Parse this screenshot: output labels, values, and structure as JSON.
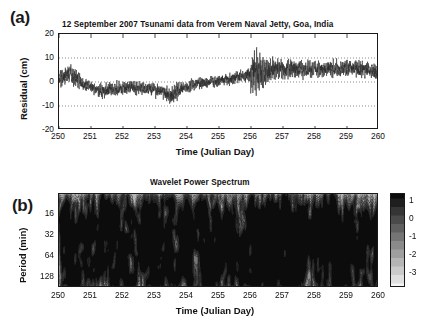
{
  "figure": {
    "panel_a_tag": "(a)",
    "panel_b_tag": "(b)"
  },
  "chart_data": [
    {
      "type": "line",
      "panel": "a",
      "title": "12  September 2007 Tsunami data from Verem Naval Jetty, Goa, India",
      "xlabel": "Time (Julian Day)",
      "ylabel": "Residual (cm)",
      "xlim": [
        250,
        260
      ],
      "ylim": [
        -20,
        20
      ],
      "xticks": [
        250,
        251,
        252,
        253,
        254,
        255,
        256,
        257,
        258,
        259,
        260
      ],
      "xticklabels": [
        "250",
        "251",
        "252",
        "253",
        "254",
        "255",
        "256",
        "257",
        "258",
        "259",
        "260"
      ],
      "yticks": [
        -20,
        -10,
        0,
        10,
        20
      ],
      "yticklabels": [
        "-20",
        "-10",
        "0",
        "10",
        "20"
      ],
      "gridlines_y": [
        -10,
        0,
        10
      ],
      "grid": "dotted-horizontal",
      "line_color": "#2b2b2b",
      "series_name": "Residual sea level",
      "sampling_interval_days": 0.0035,
      "envelope": {
        "description": "Slowly varying mean plus noise amplitude; tsunami arrival burst at Julian day 256.0",
        "mean_knots_x": [
          250.0,
          250.35,
          250.8,
          251.3,
          251.7,
          252.2,
          252.7,
          253.1,
          253.45,
          253.9,
          254.4,
          254.9,
          255.3,
          255.7,
          255.95,
          256.1,
          256.4,
          256.9,
          257.4,
          257.9,
          258.4,
          258.9,
          259.4,
          259.8,
          260.0
        ],
        "mean_knots_y": [
          2.0,
          3.2,
          -1.0,
          -3.6,
          -3.0,
          -2.2,
          -2.6,
          -3.4,
          -5.6,
          -2.4,
          -0.6,
          0.4,
          1.2,
          2.2,
          3.0,
          3.6,
          4.6,
          5.4,
          5.6,
          5.2,
          5.4,
          5.6,
          5.4,
          5.0,
          3.0
        ],
        "amp_knots_x": [
          250.0,
          250.3,
          250.9,
          251.5,
          252.1,
          252.7,
          253.3,
          253.5,
          254.0,
          254.6,
          255.2,
          255.7,
          255.95,
          256.05,
          256.2,
          256.45,
          256.8,
          257.3,
          257.9,
          258.5,
          259.1,
          259.6,
          260.0
        ],
        "amp_knots_y": [
          3.6,
          4.6,
          2.6,
          3.0,
          3.0,
          2.6,
          3.2,
          4.4,
          2.6,
          2.4,
          2.6,
          3.0,
          3.6,
          11.5,
          9.0,
          6.5,
          4.6,
          4.0,
          3.6,
          3.6,
          3.4,
          3.8,
          3.2
        ]
      },
      "annotations": [
        {
          "label": "tsunami arrival",
          "x": 256.0,
          "peak_high": 17.5,
          "peak_low": -12.0
        }
      ]
    },
    {
      "type": "heatmap",
      "panel": "b",
      "title": "Wavelet Power Spectrum",
      "xlabel": "Time (Julian Day)",
      "ylabel": "Period (min)",
      "xlim": [
        250,
        260
      ],
      "ylim_period_min": [
        8,
        180
      ],
      "yscale": "log2",
      "xticks": [
        250,
        251,
        252,
        253,
        254,
        255,
        256,
        257,
        258,
        259,
        260
      ],
      "xticklabels": [
        "250",
        "251",
        "252",
        "253",
        "254",
        "255",
        "256",
        "257",
        "258",
        "259",
        "260"
      ],
      "yticks": [
        16,
        32,
        64,
        128
      ],
      "yticklabels": [
        "16",
        "32",
        "64",
        "128"
      ],
      "grid": "none",
      "contours": true,
      "contour_color": "#303030",
      "colormap": "grayscale-banded",
      "colorbar": {
        "ticks": [
          1,
          0,
          -1,
          -2,
          -3
        ],
        "ticklabels": [
          "1",
          "0",
          "-1",
          "-2",
          "-3"
        ],
        "vmin": -3.8,
        "vmax": 1.4,
        "orientation": "vertical",
        "position": "right"
      },
      "power_field": {
        "description": "log power; high power ridges concentrated at 16-48 min, strongest after Julian day 256 (tsunami), banded contour texture throughout",
        "band_center_period_min": 26,
        "high_power_region_x": [
          256.0,
          257.6
        ],
        "background_level": -2.6,
        "ridge_level": 0.9
      }
    }
  ]
}
